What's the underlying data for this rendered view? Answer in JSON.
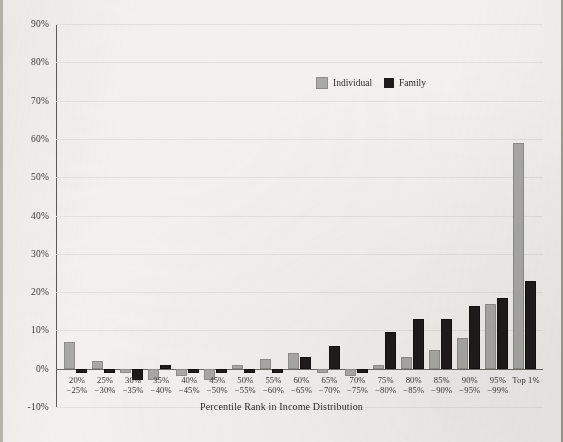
{
  "chart_data": {
    "type": "bar",
    "title": "",
    "xlabel": "Percentile Rank in Income Distribution",
    "ylabel": "",
    "ylim": [
      -10,
      90
    ],
    "ytick_step": 10,
    "grid": true,
    "legend_position": "top-right",
    "categories": [
      "20%\n-25%",
      "25%\n-30%",
      "30%\n-35%",
      "35%\n-40%",
      "40%\n-45%",
      "45%\n-50%",
      "50%\n-55%",
      "55%\n-60%",
      "60%\n-65%",
      "65%\n-70%",
      "70%\n-75%",
      "75%\n-80%",
      "80%\n-85%",
      "85%\n-90%",
      "90%\n-95%",
      "95%\n-99%",
      "Top 1%"
    ],
    "category_lines": [
      [
        "20%",
        "−25%"
      ],
      [
        "25%",
        "−30%"
      ],
      [
        "30%",
        "−35%"
      ],
      [
        "35%",
        "−40%"
      ],
      [
        "40%",
        "−45%"
      ],
      [
        "45%",
        "−50%"
      ],
      [
        "50%",
        "−55%"
      ],
      [
        "55%",
        "−60%"
      ],
      [
        "60%",
        "−65%"
      ],
      [
        "65%",
        "−70%"
      ],
      [
        "70%",
        "−75%"
      ],
      [
        "75%",
        "−80%"
      ],
      [
        "80%",
        "−85%"
      ],
      [
        "85%",
        "−90%"
      ],
      [
        "90%",
        "−95%"
      ],
      [
        "95%",
        "−99%"
      ],
      [
        "Top 1%",
        ""
      ]
    ],
    "ytick_labels": [
      "90%",
      "80%",
      "70%",
      "60%",
      "50%",
      "40%",
      "30%",
      "20%",
      "10%",
      "0%",
      "-10%"
    ],
    "ytick_values": [
      90,
      80,
      70,
      60,
      50,
      40,
      30,
      20,
      10,
      0,
      -10
    ],
    "series": [
      {
        "name": "Individual",
        "color": "#a9a9a6",
        "values": [
          7,
          2,
          -1,
          -3,
          -2,
          -3,
          1,
          2.5,
          4,
          -1,
          -2,
          1,
          3,
          5,
          8,
          17,
          59
        ]
      },
      {
        "name": "Family",
        "color": "#1d1c1a",
        "values": [
          -1,
          -1,
          -3,
          1,
          -1,
          -1,
          -1,
          -1,
          3,
          6,
          -1,
          9.5,
          13,
          13,
          16.5,
          18.5,
          23
        ]
      }
    ]
  },
  "legend": {
    "items": [
      {
        "label": "Individual",
        "color": "#a9a9a6"
      },
      {
        "label": "Family",
        "color": "#1d1c1a"
      }
    ]
  },
  "axis": {
    "x_title": "Percentile Rank in Income Distribution"
  }
}
